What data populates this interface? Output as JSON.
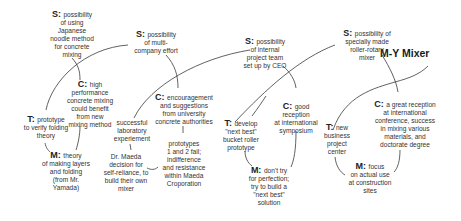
{
  "diagram": {
    "title": "M-Y Mixer",
    "stages": [
      {
        "S": {
          "key": "S:",
          "lines": [
            "possibility",
            "of using",
            "Japanese",
            "noodle method",
            "for concrete",
            "mixing"
          ]
        },
        "C": {
          "key": "C:",
          "lines": [
            "high",
            "performance",
            "concrete mixing",
            "could benefit",
            "from new",
            "mixing method"
          ]
        },
        "T": {
          "key": "T:",
          "lines": [
            "prototype",
            "to verify folding",
            "theory"
          ]
        },
        "M": {
          "key": "M:",
          "lines": [
            "theory",
            "of making layers",
            "and folding",
            "(from Mr.",
            "Yamada)"
          ]
        }
      },
      {
        "S": {
          "key": "S:",
          "lines": [
            "possibility",
            "of multi-",
            "company effort"
          ]
        },
        "C": {
          "key": "C:",
          "lines": [
            "encouragement",
            "and suggestions",
            "from university",
            "concrete authorities"
          ]
        },
        "T": {
          "key": "",
          "lines": [
            "successful",
            "laboratory",
            "experiement"
          ]
        },
        "M": {
          "key": "",
          "lines": [
            "Dr. Maeda",
            "decision for",
            "self-reliance, to",
            "build their own",
            "mixer"
          ]
        },
        "X": {
          "key": "",
          "lines": [
            "prototypes",
            "1 and 2 fail;",
            "indifference",
            "and resistance",
            "within Maeda",
            "Croporation"
          ]
        }
      },
      {
        "S": {
          "key": "S:",
          "lines": [
            "possibility",
            "of internal",
            "project team",
            "set up by CEO"
          ]
        },
        "C": {
          "key": "C:",
          "lines": [
            "good",
            "reception",
            "at international",
            "symposium"
          ]
        },
        "T": {
          "key": "T:",
          "lines": [
            "develop",
            "\"next best\"",
            "bucket roller",
            "prototype"
          ]
        },
        "M": {
          "key": "M:",
          "lines": [
            "don't try",
            "for perfection;",
            "try to build a",
            "\"next best\"",
            "solution"
          ]
        }
      },
      {
        "S": {
          "key": "S:",
          "lines": [
            "possibility of",
            "specially made",
            "roller-rotary",
            "mixer"
          ]
        },
        "C": {
          "key": "C:",
          "lines": [
            "a great reception",
            "at international",
            "conference, success",
            "in mixing various",
            "materials, and",
            "doctorate degree"
          ]
        },
        "T": {
          "key": "T:",
          "lines": [
            "new",
            "business",
            "project",
            "center"
          ]
        },
        "M": {
          "key": "M:",
          "lines": [
            "focus",
            "on actual use",
            "at construction",
            "sites"
          ]
        }
      }
    ],
    "colors": {
      "line": "#3a3a3a",
      "text": "#333333",
      "background": "#ffffff"
    }
  }
}
